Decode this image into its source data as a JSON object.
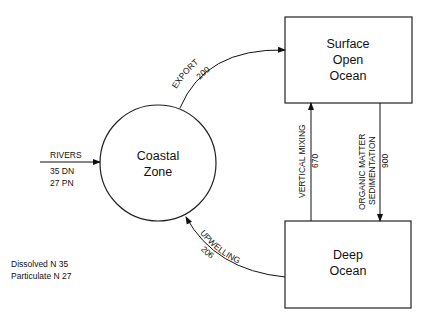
{
  "nodes": {
    "coastal_zone": {
      "lines": [
        "Coastal",
        "Zone"
      ]
    },
    "surface_ocean": {
      "lines": [
        "Surface",
        "Open",
        "Ocean"
      ]
    },
    "deep_ocean": {
      "lines": [
        "Deep",
        "Ocean"
      ]
    }
  },
  "flows": {
    "rivers": {
      "label": "RIVERS",
      "dn": "35 DN",
      "pn": "27 PN"
    },
    "export": {
      "label": "EXPORT",
      "value": "200"
    },
    "vertical_mixing": {
      "label": "VERTICAL MIXING",
      "value": "670"
    },
    "sedimentation": {
      "label_line1": "ORGANIC MATTER",
      "label_line2": "SEDIMENTATION",
      "value": "900"
    },
    "upwelling": {
      "label": "UPWELLING",
      "value": "206"
    }
  },
  "legend": {
    "line1": "Dissolved N 35",
    "line2": "Particulate N 27"
  }
}
